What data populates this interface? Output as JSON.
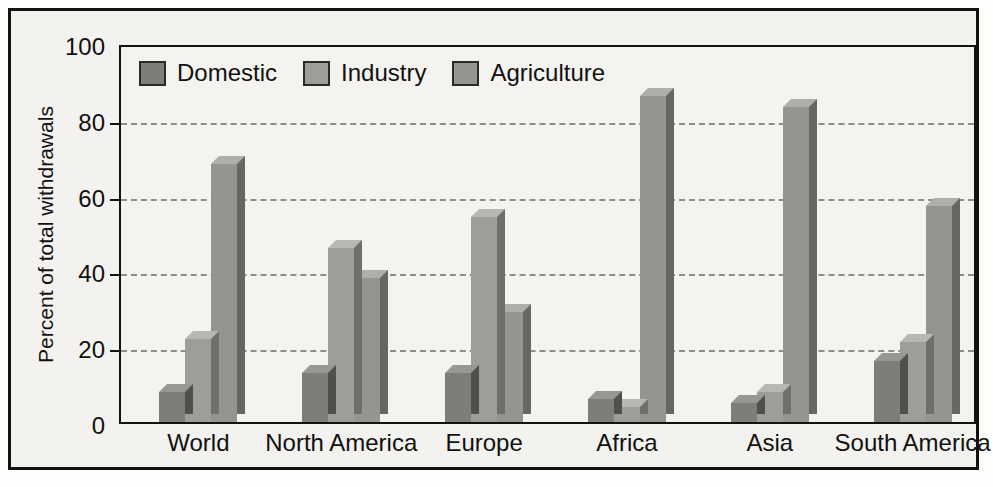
{
  "chart_data": {
    "type": "bar",
    "title": "",
    "xlabel": "",
    "ylabel": "Percent of total withdrawals",
    "ylim": [
      0,
      100
    ],
    "yticks": [
      0,
      20,
      40,
      60,
      80,
      100
    ],
    "grid": true,
    "legend_position": "top-left",
    "categories": [
      "World",
      "North America",
      "Europe",
      "Africa",
      "Asia",
      "South America"
    ],
    "series": [
      {
        "name": "Domestic",
        "color": "#7d7d7a",
        "values": [
          8,
          13,
          13,
          6,
          5,
          16
        ]
      },
      {
        "name": "Industry",
        "color": "#9d9d99",
        "values": [
          22,
          46,
          54,
          4,
          8,
          21
        ]
      },
      {
        "name": "Agriculture",
        "color": "#949491",
        "values": [
          68,
          38,
          29,
          86,
          83,
          57
        ]
      }
    ]
  },
  "axis": {
    "y_title": "Percent of total withdrawals",
    "y_tick_labels": [
      "0",
      "20",
      "40",
      "60",
      "80",
      "100"
    ]
  },
  "legend": {
    "items": [
      {
        "label": "Domestic"
      },
      {
        "label": "Industry"
      },
      {
        "label": "Agriculture"
      }
    ]
  },
  "colors": {
    "domestic": "#7d7d7a",
    "industry": "#9d9d99",
    "agriculture": "#949491",
    "frame": "#14120f",
    "background": "#f3f2ee",
    "gridline": "#8e8d89"
  }
}
